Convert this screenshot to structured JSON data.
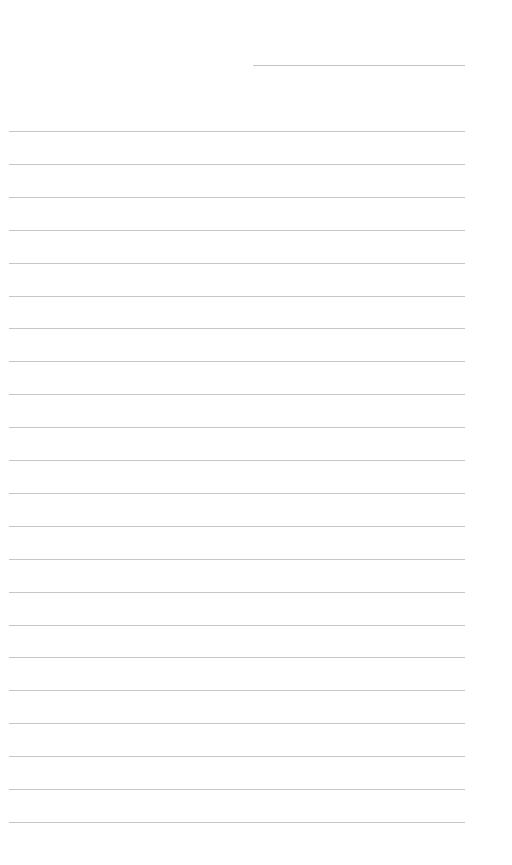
{
  "page": {
    "type": "blank lined notebook page",
    "background": "#ffffff",
    "line_color": "#c6c6c6"
  },
  "header": {
    "date_line": {
      "x": 253,
      "y": 65,
      "width": 212
    }
  },
  "ruled_lines": {
    "count": 22,
    "left": 9,
    "width": 456,
    "first_y": 131,
    "spacing": 32.9
  }
}
